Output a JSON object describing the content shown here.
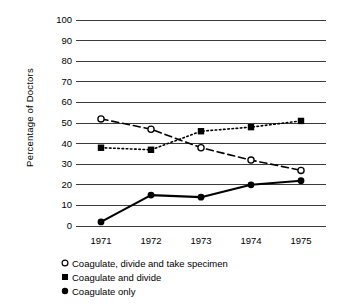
{
  "chart_data": {
    "type": "line",
    "title": "",
    "xlabel": "",
    "ylabel": "Percentage of Doctors",
    "categories": [
      "1971",
      "1972",
      "1973",
      "1974",
      "1975"
    ],
    "x": [
      1971,
      1972,
      1973,
      1974,
      1975
    ],
    "ylim": [
      0,
      100
    ],
    "yticks": [
      "100",
      "90",
      "80",
      "70",
      "60",
      "50",
      "40",
      "30",
      "20",
      "10",
      "0"
    ],
    "ytick_values": [
      100,
      90,
      80,
      70,
      60,
      50,
      40,
      30,
      20,
      10,
      0
    ],
    "grid": "horizontal",
    "legend_position": "below-left",
    "series": [
      {
        "name": "Coagulate, divide and take specimen",
        "values": [
          52,
          47,
          38,
          32,
          27
        ],
        "marker": "open-circle",
        "linestyle": "dashed",
        "color": "#000000"
      },
      {
        "name": "Coagulate and divide",
        "values": [
          38,
          37,
          46,
          48,
          51
        ],
        "marker": "filled-square",
        "linestyle": "dotted",
        "color": "#000000"
      },
      {
        "name": "Coagulate only",
        "values": [
          2,
          15,
          14,
          20,
          22
        ],
        "marker": "filled-circle",
        "linestyle": "solid",
        "color": "#000000"
      }
    ]
  },
  "axis": {
    "y_title": "Percentage of Doctors"
  },
  "legend": {
    "items": [
      {
        "marker": "open-circle-icon",
        "label": "Coagulate, divide and take specimen"
      },
      {
        "marker": "filled-square-icon",
        "label": "Coagulate and divide"
      },
      {
        "marker": "filled-circle-icon",
        "label": "Coagulate only"
      }
    ]
  }
}
